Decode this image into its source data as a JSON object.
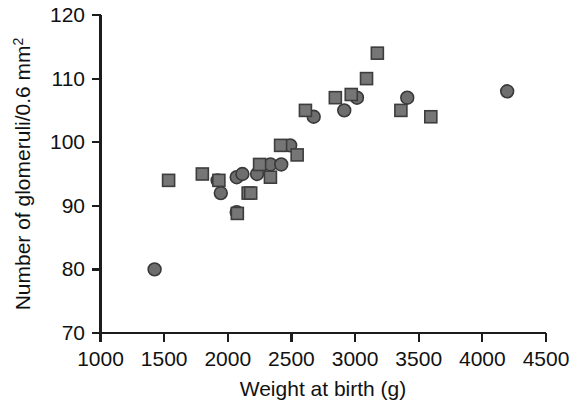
{
  "chart_data": {
    "type": "scatter",
    "title": "",
    "xlabel": "Weight at birth (g)",
    "ylabel": "Number of glomeruli/0.6 mm",
    "ylabel_superscript": "2",
    "xlim": [
      1000,
      4500
    ],
    "ylim": [
      70,
      120
    ],
    "xticks": [
      1000,
      1500,
      2000,
      2500,
      3000,
      3500,
      4000,
      4500
    ],
    "yticks": [
      70,
      80,
      90,
      100,
      110,
      120
    ],
    "xtick_labels": [
      "1000",
      "1500",
      "2000",
      "2500",
      "3000",
      "3500",
      "4000",
      "4500"
    ],
    "ytick_labels": [
      "70",
      "80",
      "90",
      "100",
      "110",
      "120"
    ],
    "grid": false,
    "legend": "none",
    "series": [
      {
        "name": "circle-marker-group",
        "marker": "circle",
        "color": "#6e6e6e",
        "edge_color": "#393939",
        "points": [
          {
            "x": 1425,
            "y": 80
          },
          {
            "x": 1920,
            "y": 94
          },
          {
            "x": 1945,
            "y": 92
          },
          {
            "x": 2070,
            "y": 89
          },
          {
            "x": 2070,
            "y": 94.5
          },
          {
            "x": 2115,
            "y": 95
          },
          {
            "x": 2230,
            "y": 95
          },
          {
            "x": 2335,
            "y": 96.5
          },
          {
            "x": 2420,
            "y": 96.5
          },
          {
            "x": 2490,
            "y": 99.5
          },
          {
            "x": 2675,
            "y": 104
          },
          {
            "x": 2915,
            "y": 105
          },
          {
            "x": 3015,
            "y": 107
          },
          {
            "x": 3410,
            "y": 107
          },
          {
            "x": 4195,
            "y": 108
          }
        ]
      },
      {
        "name": "square-marker-group",
        "marker": "square",
        "color": "#767676",
        "edge_color": "#3d3d3d",
        "points": [
          {
            "x": 1535,
            "y": 94
          },
          {
            "x": 1800,
            "y": 95
          },
          {
            "x": 1930,
            "y": 94
          },
          {
            "x": 2075,
            "y": 88.8
          },
          {
            "x": 2160,
            "y": 92
          },
          {
            "x": 2180,
            "y": 92
          },
          {
            "x": 2250,
            "y": 96.5
          },
          {
            "x": 2335,
            "y": 94.5
          },
          {
            "x": 2415,
            "y": 99.5
          },
          {
            "x": 2545,
            "y": 98
          },
          {
            "x": 2610,
            "y": 105
          },
          {
            "x": 2845,
            "y": 107
          },
          {
            "x": 2970,
            "y": 107.5
          },
          {
            "x": 3090,
            "y": 110
          },
          {
            "x": 3175,
            "y": 114
          },
          {
            "x": 3360,
            "y": 105
          },
          {
            "x": 3595,
            "y": 104
          }
        ]
      }
    ]
  },
  "axis": {
    "x_title": "Weight at birth (g)",
    "y_title_main": "Number of glomeruli/0.6 mm",
    "y_title_sup": "2"
  },
  "colors": {
    "axis": "#1c1c1c",
    "square_fill": "#767676",
    "circle_fill": "#6e6e6e",
    "background": "#ffffff"
  }
}
